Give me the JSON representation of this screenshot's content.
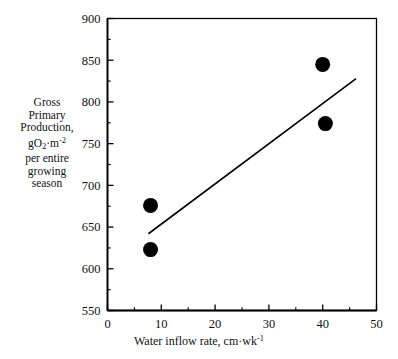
{
  "chart_data": {
    "type": "scatter",
    "title": "",
    "xlabel": "Water inflow rate, cm·wk",
    "xlabel_sup": "-1",
    "ylabel_lines": [
      "Gross",
      "Primary",
      "Production,",
      "gO2·m -2",
      "per  entire",
      "growing",
      "season"
    ],
    "ylabel_parts": {
      "l1": "Gross",
      "l2": "Primary",
      "l3": "Production,",
      "l4_a": "gO",
      "l4_sub": "2",
      "l4_b": "·m",
      "l4_sup": "-2",
      "l5": "per  entire",
      "l6": "growing",
      "l7": "season"
    },
    "xlim": [
      0,
      50
    ],
    "ylim": [
      550,
      900
    ],
    "xticks": [
      0,
      10,
      20,
      30,
      40,
      50
    ],
    "xticklabels": [
      "0",
      "10",
      "20",
      "30",
      "40",
      "50"
    ],
    "xminorticks": [
      5,
      15,
      25,
      35,
      45
    ],
    "yticks": [
      550,
      600,
      650,
      700,
      750,
      800,
      850,
      900
    ],
    "yticklabels": [
      "550",
      "600",
      "650",
      "700",
      "750",
      "800",
      "850",
      "900"
    ],
    "yminorticks": [
      575,
      625,
      675,
      725,
      775,
      825,
      875
    ],
    "grid": false,
    "legend": false,
    "points": [
      {
        "x": 8.0,
        "y": 676
      },
      {
        "x": 8.0,
        "y": 623
      },
      {
        "x": 40.0,
        "y": 845
      },
      {
        "x": 40.5,
        "y": 774
      }
    ],
    "trendline": {
      "name": "regression-line",
      "x0": 7.6,
      "y0": 642,
      "x1": 46.2,
      "y1": 828
    },
    "colors": {
      "marker": "#000000",
      "line": "#000000",
      "axis": "#000000",
      "background": "#ffffff",
      "text": "#111111"
    },
    "marker_radius_px": 7.5
  }
}
